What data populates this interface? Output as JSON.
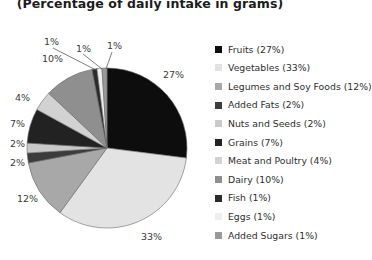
{
  "chart_data": {
    "type": "pie",
    "title": "(Percentage of daily intake in grams)",
    "xlabel": "",
    "ylabel": "",
    "legend_position": "right",
    "grid": false,
    "start_angle_deg": 0,
    "direction": "clockwise",
    "categories": [
      "Fruits",
      "Vegetables",
      "Legumes and Soy Foods",
      "Added Fats",
      "Nuts and Seeds",
      "Grains",
      "Meat and Poultry",
      "Dairy",
      "Fish",
      "Eggs",
      "Added Sugars"
    ],
    "values": [
      27,
      33,
      12,
      2,
      2,
      7,
      4,
      10,
      1,
      1,
      1
    ],
    "value_unit": "%",
    "colors": [
      "#0d0d0d",
      "#e3e3e3",
      "#a8a8a8",
      "#3c3c3c",
      "#c9c9c9",
      "#222222",
      "#d2d2d2",
      "#8f8f8f",
      "#2b2b2b",
      "#efefef",
      "#999999"
    ],
    "slice_labels": [
      "27%",
      "33%",
      "12%",
      "2%",
      "2%",
      "7%",
      "4%",
      "10%",
      "1%",
      "1%",
      "1%"
    ],
    "geometry": {
      "center_x": 107,
      "center_y": 148,
      "radius": 80
    }
  },
  "legend": {
    "items": [
      {
        "label": "Fruits (27%)",
        "color": "#0d0d0d"
      },
      {
        "label": "Vegetables (33%)",
        "color": "#e3e3e3"
      },
      {
        "label": "Legumes and Soy Foods (12%)",
        "color": "#a8a8a8"
      },
      {
        "label": "Added Fats (2%)",
        "color": "#3c3c3c"
      },
      {
        "label": "Nuts and Seeds (2%)",
        "color": "#c9c9c9"
      },
      {
        "label": "Grains (7%)",
        "color": "#222222"
      },
      {
        "label": "Meat and Poultry (4%)",
        "color": "#d2d2d2"
      },
      {
        "label": "Dairy (10%)",
        "color": "#8f8f8f"
      },
      {
        "label": "Fish (1%)",
        "color": "#2b2b2b"
      },
      {
        "label": "Eggs (1%)",
        "color": "#efefef"
      },
      {
        "label": "Added Sugars (1%)",
        "color": "#999999"
      }
    ]
  },
  "labels": {
    "l27": "27%",
    "l33": "33%",
    "l12": "12%",
    "l2a": "2%",
    "l2b": "2%",
    "l7": "7%",
    "l4": "4%",
    "l10": "10%",
    "l1a": "1%",
    "l1b": "1%",
    "l1c": "1%"
  }
}
